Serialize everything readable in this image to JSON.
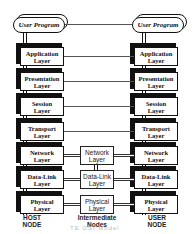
{
  "diagram": {
    "host_stack": {
      "top": "User Program",
      "layers": [
        "Application\nLayer",
        "Presentation\nLayer",
        "Session\nLayer",
        "Transport\nLayer",
        "Network\nLayer",
        "Data-Link\nLayer",
        "Physical\nLayer"
      ],
      "caption": "HOST\nNODE"
    },
    "user_stack": {
      "top": "User Program",
      "layers": [
        "Application\nLayer",
        "Presentation\nLayer",
        "Session\nLayer",
        "Transport\nLayer",
        "Network\nLayer",
        "Data-Link\nLayer",
        "Physical\nLayer"
      ],
      "caption": "USER\nNODE"
    },
    "intermediate": {
      "layers": [
        "Network\nLayer",
        "Data-Link\nLayer",
        "Physical\nLayer"
      ],
      "caption": "Intermediate\nNodes"
    },
    "footer_faint": "TE  OSI Model"
  }
}
